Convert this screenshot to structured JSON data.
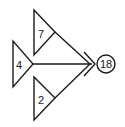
{
  "diagram": {
    "type": "flow-merge",
    "inputs": [
      {
        "id": "top",
        "value": "7"
      },
      {
        "id": "left",
        "value": "4"
      },
      {
        "id": "bottom",
        "value": "2"
      }
    ],
    "output": {
      "value": "18"
    }
  }
}
